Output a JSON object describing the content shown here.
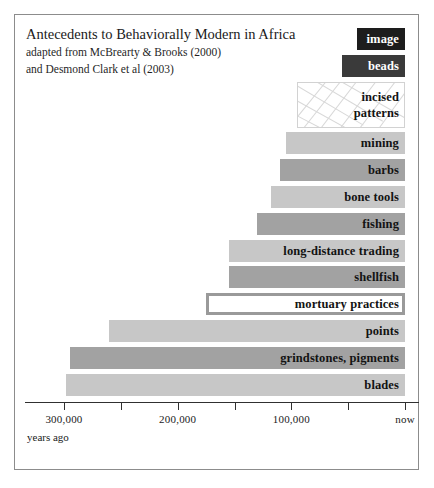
{
  "figure": {
    "title": "Antecedents to Behaviorally Modern in Africa",
    "subtitle_line1": "adapted from McBrearty & Brooks (2000)",
    "subtitle_line2": "and Desmond Clark et al (2003)",
    "axis_caption": "years ago"
  },
  "chart_data": {
    "type": "bar",
    "orientation": "horizontal",
    "title": "Antecedents to Behaviorally Modern in Africa",
    "subtitle": "adapted from McBrearty & Brooks (2000) and Desmond Clark et al (2003)",
    "xlabel": "years ago",
    "ylabel": "",
    "grid": false,
    "legend": "none",
    "x_axis_direction": "reversed",
    "xlim": [
      300000,
      0
    ],
    "xticks": [
      300000,
      250000,
      200000,
      150000,
      100000,
      50000,
      0
    ],
    "xtick_labels": [
      "300,000",
      "",
      "200,000",
      "",
      "100,000",
      "",
      "now"
    ],
    "note": "Each bar spans from its first-appearance date (left end) to the present (right end, 'now').",
    "categories": [
      "image",
      "beads",
      "incised patterns",
      "mining",
      "barbs",
      "bone tools",
      "fishing",
      "long-distance trading",
      "shellfish",
      "mortuary practices",
      "points",
      "grindstones, pigments",
      "blades"
    ],
    "values": [
      {
        "label": "image",
        "start_years_ago": 42000,
        "end_years_ago": 0,
        "fill": "#1d1d1d",
        "text_color": "#ffffff",
        "style": "solid"
      },
      {
        "label": "beads",
        "start_years_ago": 55000,
        "end_years_ago": 0,
        "fill": "#3a3a3a",
        "text_color": "#ffffff",
        "style": "solid"
      },
      {
        "label": "incised patterns",
        "start_years_ago": 95000,
        "end_years_ago": 0,
        "fill": "#ffffff",
        "text_color": "#131313",
        "style": "hatched"
      },
      {
        "label": "mining",
        "start_years_ago": 105000,
        "end_years_ago": 0,
        "fill": "#c7c7c7",
        "text_color": "#131313",
        "style": "solid"
      },
      {
        "label": "barbs",
        "start_years_ago": 110000,
        "end_years_ago": 0,
        "fill": "#a2a2a2",
        "text_color": "#131313",
        "style": "solid"
      },
      {
        "label": "bone tools",
        "start_years_ago": 118000,
        "end_years_ago": 0,
        "fill": "#c7c7c7",
        "text_color": "#131313",
        "style": "solid"
      },
      {
        "label": "fishing",
        "start_years_ago": 130000,
        "end_years_ago": 0,
        "fill": "#a2a2a2",
        "text_color": "#131313",
        "style": "solid"
      },
      {
        "label": "long-distance trading",
        "start_years_ago": 155000,
        "end_years_ago": 0,
        "fill": "#c7c7c7",
        "text_color": "#131313",
        "style": "solid"
      },
      {
        "label": "shellfish",
        "start_years_ago": 155000,
        "end_years_ago": 0,
        "fill": "#a2a2a2",
        "text_color": "#131313",
        "style": "solid"
      },
      {
        "label": "mortuary practices",
        "start_years_ago": 175000,
        "end_years_ago": 0,
        "fill": "#ffffff",
        "text_color": "#131313",
        "style": "outlined"
      },
      {
        "label": "points",
        "start_years_ago": 260000,
        "end_years_ago": 0,
        "fill": "#c7c7c7",
        "text_color": "#131313",
        "style": "solid"
      },
      {
        "label": "grindstones, pigments",
        "start_years_ago": 295000,
        "end_years_ago": 0,
        "fill": "#a2a2a2",
        "text_color": "#131313",
        "style": "solid"
      },
      {
        "label": "blades",
        "start_years_ago": 298000,
        "end_years_ago": 0,
        "fill": "#c7c7c7",
        "text_color": "#131313",
        "style": "solid"
      }
    ],
    "colors": {
      "bar_light_gray": "#c7c7c7",
      "bar_dark_gray": "#a2a2a2",
      "bar_black": "#1d1d1d",
      "bar_charcoal": "#3a3a3a",
      "outline_gray": "#9a9a9a",
      "frame": "#8c8c8c",
      "axis": "#303030"
    }
  }
}
